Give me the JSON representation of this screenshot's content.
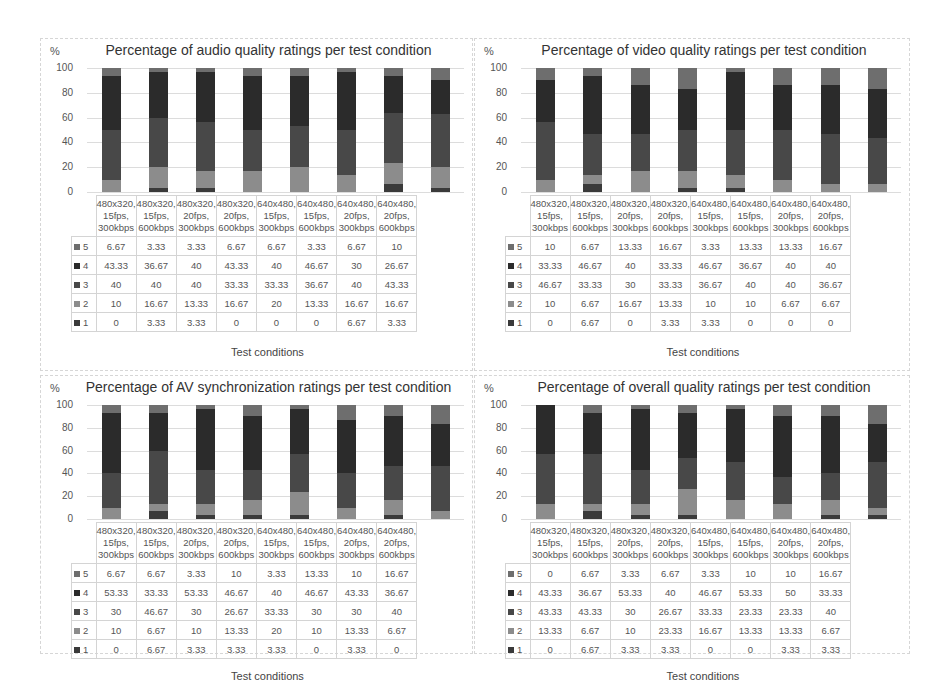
{
  "legend_colors": {
    "5": "#6e6e6e",
    "4": "#2b2b2b",
    "3": "#484848",
    "2": "#8c8c8c",
    "1": "#3a3a3a"
  },
  "series_order": [
    "5",
    "4",
    "3",
    "2",
    "1"
  ],
  "yticks": [
    "100",
    "80",
    "60",
    "40",
    "20",
    "0"
  ],
  "ylabel": "%",
  "xlabel": "Test conditions",
  "categories": [
    [
      "480x320,",
      "15fps,",
      "300kbps"
    ],
    [
      "480x320,",
      "15fps,",
      "600kbps"
    ],
    [
      "480x320,",
      "20fps,",
      "300kbps"
    ],
    [
      "480x320,",
      "20fps,",
      "600kbps"
    ],
    [
      "640x480,",
      "15fps,",
      "300kbps"
    ],
    [
      "640x480,",
      "15fps,",
      "600kbps"
    ],
    [
      "640x480,",
      "20fps,",
      "300kbps"
    ],
    [
      "640x480,",
      "20fps,",
      "600kbps"
    ]
  ],
  "chart_data": [
    {
      "id": "audio",
      "type": "bar",
      "stacked": true,
      "title": "Percentage of audio quality ratings per test condition",
      "ylabel": "%",
      "xlabel": "Test conditions",
      "ylim": [
        0,
        100
      ],
      "grid": true,
      "legend_position": "table",
      "categories": [
        "480x320, 15fps, 300kbps",
        "480x320, 15fps, 600kbps",
        "480x320, 20fps, 300kbps",
        "480x320, 20fps, 600kbps",
        "640x480, 15fps, 300kbps",
        "640x480, 15fps, 600kbps",
        "640x480, 20fps, 300kbps",
        "640x480, 20fps, 600kbps"
      ],
      "series": [
        {
          "name": "5",
          "values": [
            "6.67",
            "3.33",
            "3.33",
            "6.67",
            "6.67",
            "3.33",
            "6.67",
            "10"
          ]
        },
        {
          "name": "4",
          "values": [
            "43.33",
            "36.67",
            "40",
            "43.33",
            "40",
            "46.67",
            "30",
            "26.67"
          ]
        },
        {
          "name": "3",
          "values": [
            "40",
            "40",
            "40",
            "33.33",
            "33.33",
            "36.67",
            "40",
            "43.33"
          ]
        },
        {
          "name": "2",
          "values": [
            "10",
            "16.67",
            "13.33",
            "16.67",
            "20",
            "13.33",
            "16.67",
            "16.67"
          ]
        },
        {
          "name": "1",
          "values": [
            "0",
            "3.33",
            "3.33",
            "0",
            "0",
            "0",
            "6.67",
            "3.33"
          ]
        }
      ]
    },
    {
      "id": "video",
      "type": "bar",
      "stacked": true,
      "title": "Percentage of video quality ratings per test condition",
      "ylabel": "%",
      "xlabel": "Test conditions",
      "ylim": [
        0,
        100
      ],
      "grid": true,
      "legend_position": "table",
      "categories": [
        "480x320, 15fps, 300kbps",
        "480x320, 15fps, 600kbps",
        "480x320, 20fps, 300kbps",
        "480x320, 20fps, 600kbps",
        "640x480, 15fps, 300kbps",
        "640x480, 15fps, 600kbps",
        "640x480, 20fps, 300kbps",
        "640x480, 20fps, 600kbps"
      ],
      "series": [
        {
          "name": "5",
          "values": [
            "10",
            "6.67",
            "13.33",
            "16.67",
            "3.33",
            "13.33",
            "13.33",
            "16.67"
          ]
        },
        {
          "name": "4",
          "values": [
            "33.33",
            "46.67",
            "40",
            "33.33",
            "46.67",
            "36.67",
            "40",
            "40"
          ]
        },
        {
          "name": "3",
          "values": [
            "46.67",
            "33.33",
            "30",
            "33.33",
            "36.67",
            "40",
            "40",
            "36.67"
          ]
        },
        {
          "name": "2",
          "values": [
            "10",
            "6.67",
            "16.67",
            "13.33",
            "10",
            "10",
            "6.67",
            "6.67"
          ]
        },
        {
          "name": "1",
          "values": [
            "0",
            "6.67",
            "0",
            "3.33",
            "3.33",
            "0",
            "0",
            "0"
          ]
        }
      ]
    },
    {
      "id": "av",
      "type": "bar",
      "stacked": true,
      "title": "Percentage of AV synchronization ratings per test condition",
      "ylabel": "%",
      "xlabel": "Test conditions",
      "ylim": [
        0,
        100
      ],
      "grid": true,
      "legend_position": "table",
      "categories": [
        "480x320, 15fps, 300kbps",
        "480x320, 15fps, 600kbps",
        "480x320, 20fps, 300kbps",
        "480x320, 20fps, 600kbps",
        "640x480, 15fps, 300kbps",
        "640x480, 15fps, 600kbps",
        "640x480, 20fps, 300kbps",
        "640x480, 20fps, 600kbps"
      ],
      "series": [
        {
          "name": "5",
          "values": [
            "6.67",
            "6.67",
            "3.33",
            "10",
            "3.33",
            "13.33",
            "10",
            "16.67"
          ]
        },
        {
          "name": "4",
          "values": [
            "53.33",
            "33.33",
            "53.33",
            "46.67",
            "40",
            "46.67",
            "43.33",
            "36.67"
          ]
        },
        {
          "name": "3",
          "values": [
            "30",
            "46.67",
            "30",
            "26.67",
            "33.33",
            "30",
            "30",
            "40"
          ]
        },
        {
          "name": "2",
          "values": [
            "10",
            "6.67",
            "10",
            "13.33",
            "20",
            "10",
            "13.33",
            "6.67"
          ]
        },
        {
          "name": "1",
          "values": [
            "0",
            "6.67",
            "3.33",
            "3.33",
            "3.33",
            "0",
            "3.33",
            "0"
          ]
        }
      ]
    },
    {
      "id": "overall",
      "type": "bar",
      "stacked": true,
      "title": "Percentage of overall quality ratings per test condition",
      "ylabel": "%",
      "xlabel": "Test conditions",
      "ylim": [
        0,
        100
      ],
      "grid": true,
      "legend_position": "table",
      "categories": [
        "480x320, 15fps, 300kbps",
        "480x320, 15fps, 600kbps",
        "480x320, 20fps, 300kbps",
        "480x320, 20fps, 600kbps",
        "640x480, 15fps, 300kbps",
        "640x480, 15fps, 600kbps",
        "640x480, 20fps, 300kbps",
        "640x480, 20fps, 600kbps"
      ],
      "series": [
        {
          "name": "5",
          "values": [
            "0",
            "6.67",
            "3.33",
            "6.67",
            "3.33",
            "10",
            "10",
            "16.67"
          ]
        },
        {
          "name": "4",
          "values": [
            "43.33",
            "36.67",
            "53.33",
            "40",
            "46.67",
            "53.33",
            "50",
            "33.33"
          ]
        },
        {
          "name": "3",
          "values": [
            "43.33",
            "43.33",
            "30",
            "26.67",
            "33.33",
            "23.33",
            "23.33",
            "40"
          ]
        },
        {
          "name": "2",
          "values": [
            "13.33",
            "6.67",
            "10",
            "23.33",
            "16.67",
            "13.33",
            "13.33",
            "6.67"
          ]
        },
        {
          "name": "1",
          "values": [
            "0",
            "6.67",
            "3.33",
            "3.33",
            "0",
            "0",
            "3.33",
            "3.33"
          ]
        }
      ]
    }
  ]
}
